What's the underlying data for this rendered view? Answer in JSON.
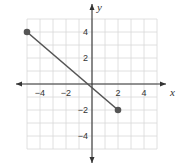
{
  "chart_data": {
    "type": "line",
    "title": "",
    "xlabel": "x",
    "ylabel": "y",
    "xlim": [
      -5,
      5
    ],
    "ylim": [
      -5,
      5
    ],
    "grid": true,
    "x_ticks": [
      -4,
      -2,
      2,
      4
    ],
    "y_ticks": [
      4,
      2,
      -2,
      -4
    ],
    "x_tick_labels": [
      "−4",
      "−2",
      "2",
      "4"
    ],
    "y_tick_labels": [
      "4",
      "2",
      "−2",
      "−4"
    ],
    "series": [
      {
        "name": "segment",
        "points": [
          [
            -5,
            4
          ],
          [
            2,
            -2
          ]
        ],
        "endpoints": "closed",
        "color": "#555555"
      }
    ]
  },
  "colors": {
    "grid": "#d8d8d8",
    "axis": "#333333",
    "line": "#555555"
  }
}
